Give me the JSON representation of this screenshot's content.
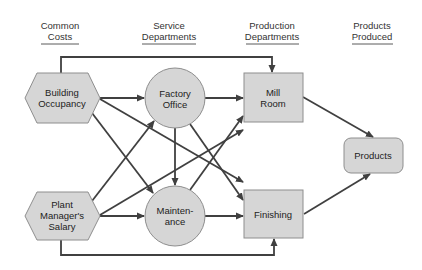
{
  "colors": {
    "node_fill": "#d6d6d6",
    "node_stroke": "#8e8e8e",
    "edge": "#404040",
    "header_text": "#333333",
    "underline": "#5a5a5a"
  },
  "headers": [
    {
      "line1": "Common",
      "line2": "Costs"
    },
    {
      "line1": "Service",
      "line2": "Departments"
    },
    {
      "line1": "Production",
      "line2": "Departments"
    },
    {
      "line1": "Products",
      "line2": "Produced"
    }
  ],
  "nodes": {
    "building_occupancy": {
      "shape": "hexagon",
      "line1": "Building",
      "line2": "Occupancy"
    },
    "plant_managers_salary": {
      "shape": "hexagon",
      "line1": "Plant",
      "line2": "Manager's",
      "line3": "Salary"
    },
    "factory_office": {
      "shape": "circle",
      "line1": "Factory",
      "line2": "Office"
    },
    "maintenance": {
      "shape": "circle",
      "line1": "Mainten-",
      "line2": "ance"
    },
    "mill_room": {
      "shape": "rectangle",
      "line1": "Mill",
      "line2": "Room"
    },
    "finishing": {
      "shape": "rectangle",
      "line1": "Finishing"
    },
    "products": {
      "shape": "rounded-rectangle",
      "line1": "Products"
    }
  },
  "edges": [
    {
      "from": "Building Occupancy",
      "to": "Factory Office"
    },
    {
      "from": "Building Occupancy",
      "to": "Maintenance"
    },
    {
      "from": "Building Occupancy",
      "to": "Finishing"
    },
    {
      "from": "Building Occupancy",
      "to": "Mill Room"
    },
    {
      "from": "Plant Manager's Salary",
      "to": "Maintenance"
    },
    {
      "from": "Plant Manager's Salary",
      "to": "Factory Office"
    },
    {
      "from": "Plant Manager's Salary",
      "to": "Mill Room"
    },
    {
      "from": "Plant Manager's Salary",
      "to": "Finishing"
    },
    {
      "from": "Factory Office",
      "to": "Mill Room"
    },
    {
      "from": "Factory Office",
      "to": "Maintenance"
    },
    {
      "from": "Factory Office",
      "to": "Finishing"
    },
    {
      "from": "Maintenance",
      "to": "Mill Room"
    },
    {
      "from": "Maintenance",
      "to": "Finishing"
    },
    {
      "from": "Mill Room",
      "to": "Products"
    },
    {
      "from": "Finishing",
      "to": "Products"
    }
  ]
}
